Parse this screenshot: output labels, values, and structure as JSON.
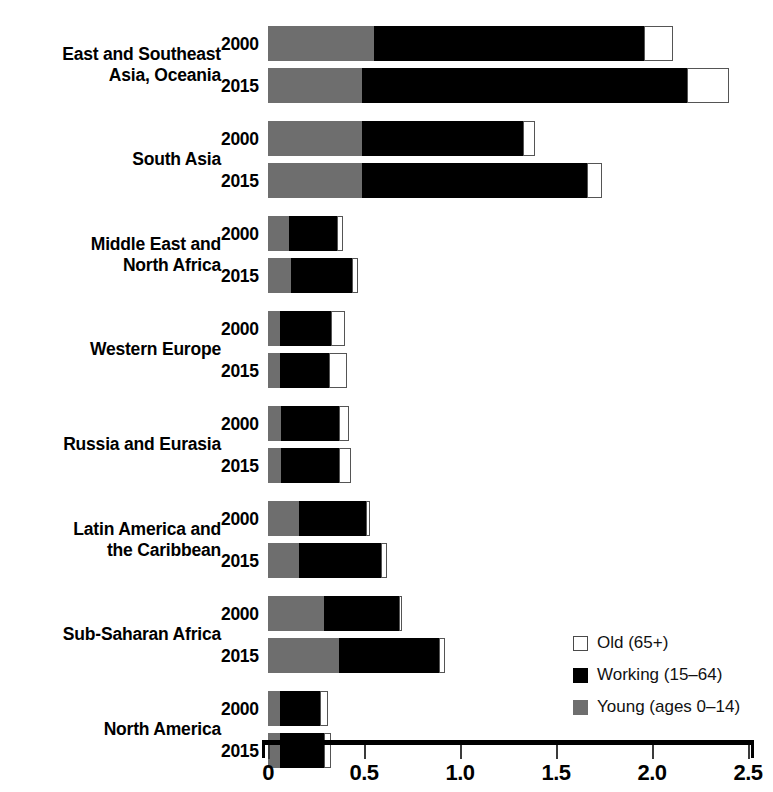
{
  "chart_data": {
    "type": "bar",
    "orientation": "horizontal",
    "stacked": true,
    "title": "",
    "xlabel": "",
    "ylabel": "",
    "xlim": [
      0,
      2.5
    ],
    "xticks": [
      "0",
      "0.5",
      "1.0",
      "1.5",
      "2.0",
      "2.5"
    ],
    "xtick_values": [
      0,
      0.5,
      1.0,
      1.5,
      2.0,
      2.5
    ],
    "grid": false,
    "legend_position": "bottom-right",
    "series": [
      {
        "name": "Old (65+)",
        "key": "old",
        "color": "#ffffff"
      },
      {
        "name": "Working (15–64)",
        "key": "working",
        "color": "#000000"
      },
      {
        "name": "Young (ages 0–14)",
        "key": "young",
        "color": "#6e6e6e"
      }
    ],
    "categories": [
      "East and Southeast Asia, Oceania",
      "South Asia",
      "Middle East and North Africa",
      "Western Europe",
      "Russia and Eurasia",
      "Latin America and the Caribbean",
      "Sub-Saharan Africa",
      "North America"
    ],
    "groups": [
      {
        "label_lines": [
          "East and Southeast",
          "Asia, Oceania"
        ],
        "rows": [
          {
            "year": "2000",
            "young": 0.55,
            "working": 1.41,
            "old": 0.15,
            "total": 2.11
          },
          {
            "year": "2015",
            "young": 0.49,
            "working": 1.69,
            "old": 0.22,
            "total": 2.4
          }
        ]
      },
      {
        "label_lines": [
          "South Asia"
        ],
        "rows": [
          {
            "year": "2000",
            "young": 0.49,
            "working": 0.84,
            "old": 0.06,
            "total": 1.39
          },
          {
            "year": "2015",
            "young": 0.49,
            "working": 1.17,
            "old": 0.08,
            "total": 1.74
          }
        ]
      },
      {
        "label_lines": [
          "Middle East and",
          "North Africa"
        ],
        "rows": [
          {
            "year": "2000",
            "young": 0.11,
            "working": 0.25,
            "old": 0.03,
            "total": 0.39
          },
          {
            "year": "2015",
            "young": 0.12,
            "working": 0.32,
            "old": 0.03,
            "total": 0.47
          }
        ]
      },
      {
        "label_lines": [
          "Western Europe"
        ],
        "rows": [
          {
            "year": "2000",
            "young": 0.06,
            "working": 0.27,
            "old": 0.07,
            "total": 0.4
          },
          {
            "year": "2015",
            "young": 0.06,
            "working": 0.26,
            "old": 0.09,
            "total": 0.41
          }
        ]
      },
      {
        "label_lines": [
          "Russia and Eurasia"
        ],
        "rows": [
          {
            "year": "2000",
            "young": 0.07,
            "working": 0.3,
            "old": 0.05,
            "total": 0.42
          },
          {
            "year": "2015",
            "young": 0.07,
            "working": 0.3,
            "old": 0.06,
            "total": 0.43
          }
        ]
      },
      {
        "label_lines": [
          "Latin America and",
          "the Caribbean"
        ],
        "rows": [
          {
            "year": "2000",
            "young": 0.16,
            "working": 0.35,
            "old": 0.02,
            "total": 0.53
          },
          {
            "year": "2015",
            "young": 0.16,
            "working": 0.43,
            "old": 0.03,
            "total": 0.62
          }
        ]
      },
      {
        "label_lines": [
          "Sub-Saharan Africa"
        ],
        "rows": [
          {
            "year": "2000",
            "young": 0.29,
            "working": 0.39,
            "old": 0.02,
            "total": 0.7
          },
          {
            "year": "2015",
            "young": 0.37,
            "working": 0.52,
            "old": 0.03,
            "total": 0.92
          }
        ]
      },
      {
        "label_lines": [
          "North America"
        ],
        "rows": [
          {
            "year": "2000",
            "young": 0.06,
            "working": 0.21,
            "old": 0.04,
            "total": 0.31
          },
          {
            "year": "2015",
            "young": 0.06,
            "working": 0.23,
            "old": 0.04,
            "total": 0.33
          }
        ]
      }
    ]
  },
  "legend": {
    "items": [
      {
        "label": "Old (65+)",
        "swatch": "old"
      },
      {
        "label": "Working (15–64)",
        "swatch": "working"
      },
      {
        "label": "Young (ages 0–14)",
        "swatch": "young"
      }
    ]
  },
  "colors": {
    "young": "#6e6e6e",
    "working": "#000000",
    "old": "#ffffff",
    "axis": "#000000",
    "text": "#000000"
  }
}
